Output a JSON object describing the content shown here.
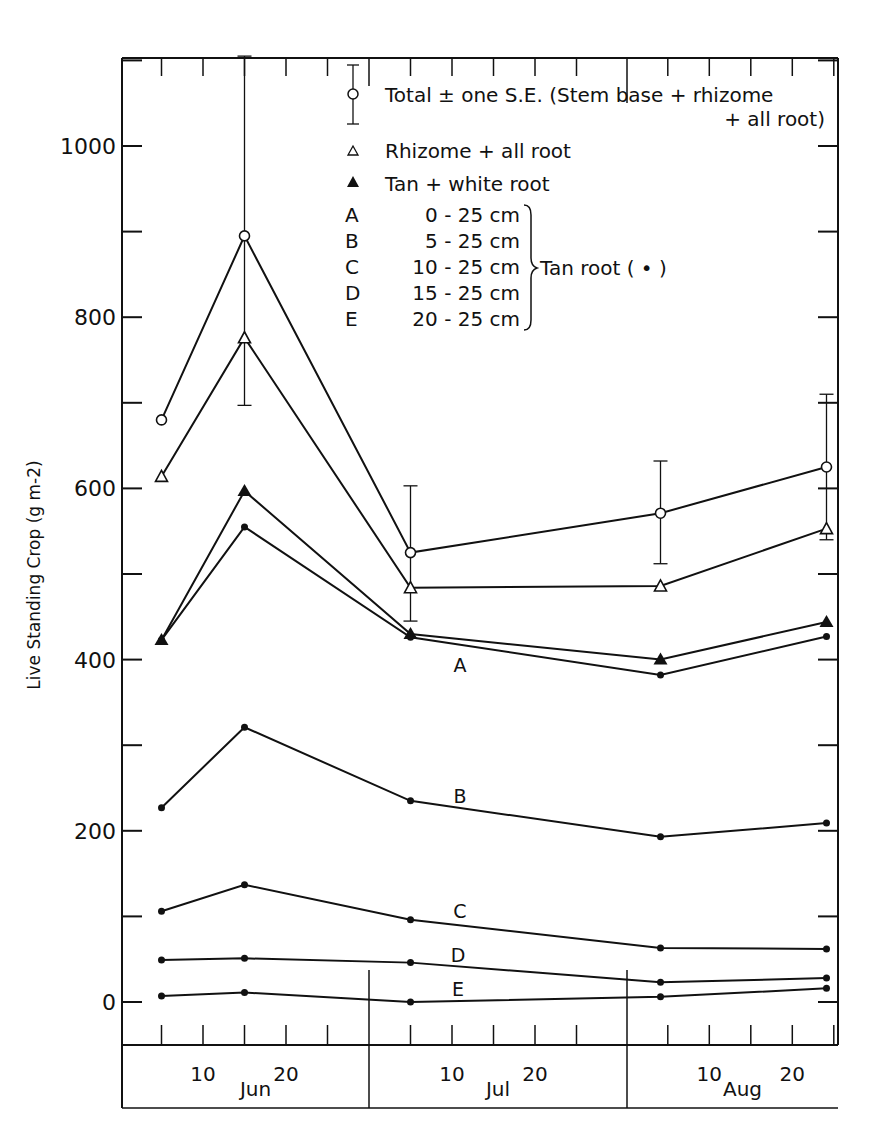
{
  "chart_data": {
    "type": "line",
    "title": "",
    "ylabel": "Live Standing Crop (g m-2)",
    "xlabel": "",
    "ylim": [
      -80,
      1105
    ],
    "y_ticks_labeled": [
      0,
      200,
      400,
      600,
      800,
      1000
    ],
    "y_ticks_minor_step": 100,
    "months": [
      "Jun",
      "Jul",
      "Aug"
    ],
    "x_tick_labels": [
      "10",
      "20"
    ],
    "x": [
      "Jun 5",
      "Jun 15",
      "Jul 5",
      "Aug 4",
      "Aug 24"
    ],
    "x_day_offset": [
      5,
      15,
      35,
      65,
      85
    ],
    "grid": false,
    "legend_position": "upper right (inside)",
    "series": [
      {
        "name": "Total ± one S.E. (Stem base + rhizome + all root)",
        "marker": "open-circle",
        "values": [
          680,
          895,
          525,
          571,
          625
        ],
        "se_low": [
          null,
          697,
          445,
          512,
          540
        ],
        "se_high": [
          null,
          1105,
          603,
          632,
          710
        ]
      },
      {
        "name": "Rhizome + all root",
        "marker": "open-triangle",
        "values": [
          614,
          776,
          484,
          486,
          553
        ]
      },
      {
        "name": "Tan + white root",
        "marker": "filled-triangle",
        "values": [
          423,
          597,
          430,
          400,
          444
        ]
      },
      {
        "name": "A 0 - 25cm (Tan root)",
        "marker": "dot",
        "label": "A",
        "values": [
          423,
          555,
          426,
          382,
          427
        ]
      },
      {
        "name": "B 5 - 25cm (Tan root)",
        "marker": "dot",
        "label": "B",
        "values": [
          227,
          321,
          235,
          193,
          209
        ]
      },
      {
        "name": "C 10 - 25cm (Tan root)",
        "marker": "dot",
        "label": "C",
        "values": [
          106,
          137,
          96,
          63,
          62
        ]
      },
      {
        "name": "D 15 - 25cm (Tan root)",
        "marker": "dot",
        "label": "D",
        "values": [
          49,
          51,
          46,
          23,
          28
        ]
      },
      {
        "name": "E 20 - 25cm (Tan root)",
        "marker": "dot",
        "label": "E",
        "values": [
          7,
          11,
          0,
          6,
          16
        ]
      }
    ],
    "legend": {
      "total_line1": "Total  ±  one  S.E. (Stem base + rhizome",
      "total_line2": "+ all root)",
      "rhizome": "Rhizome + all root",
      "tanwhite": "Tan + white root",
      "depths": [
        {
          "letter": "A",
          "range": "0  - 25 cm"
        },
        {
          "letter": "B",
          "range": "5  - 25 cm"
        },
        {
          "letter": "C",
          "range": "10 - 25 cm"
        },
        {
          "letter": "D",
          "range": "15 - 25 cm"
        },
        {
          "letter": "E",
          "range": "20 - 25 cm"
        }
      ],
      "brace_label": "Tan root ( • )"
    }
  }
}
